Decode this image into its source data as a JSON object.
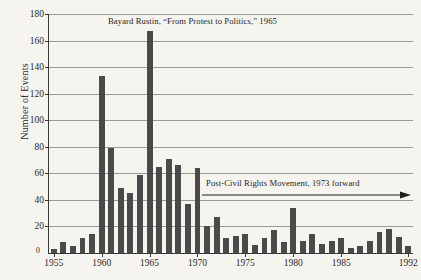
{
  "chart_data": {
    "type": "bar",
    "title": "",
    "xlabel": "",
    "ylabel": "Number of Events",
    "ylim": [
      0,
      180
    ],
    "xlim": [
      1955,
      1992
    ],
    "grid": true,
    "legend": false,
    "bar_color": "#4a4a4a",
    "background_color": "#f6f4ef",
    "axis_color": "#3a3a3a",
    "gridline_color": "#9a9a96",
    "yticks": [
      0,
      20,
      40,
      60,
      80,
      100,
      120,
      140,
      160,
      180
    ],
    "ytick_labels": [
      "0",
      "20",
      "40",
      "60",
      "80",
      "100",
      "120",
      "140",
      "160",
      "180"
    ],
    "xticks": [
      1955,
      1960,
      1965,
      1970,
      1975,
      1980,
      1985,
      1992
    ],
    "xtick_labels": [
      "1955",
      "1960",
      "1965",
      "1970",
      "1975",
      "1980",
      "1985",
      "1992"
    ],
    "categories": [
      1955,
      1956,
      1957,
      1958,
      1959,
      1960,
      1961,
      1962,
      1963,
      1964,
      1965,
      1966,
      1967,
      1968,
      1969,
      1970,
      1971,
      1972,
      1973,
      1974,
      1975,
      1976,
      1977,
      1978,
      1979,
      1980,
      1981,
      1982,
      1983,
      1984,
      1985,
      1986,
      1987,
      1988,
      1989,
      1990,
      1991,
      1992
    ],
    "values": [
      3,
      8,
      5,
      11,
      14,
      133,
      79,
      49,
      45,
      59,
      167,
      65,
      71,
      66,
      37,
      64,
      20,
      27,
      11,
      13,
      14,
      6,
      11,
      17,
      8,
      34,
      9,
      14,
      7,
      9,
      11,
      4,
      5,
      9,
      16,
      18,
      12,
      5
    ],
    "annotations": [
      {
        "id": "rustin",
        "text": "Bayard Rustin, “From Protest to Politics,” 1965",
        "target_year": 1965
      },
      {
        "id": "post-civil-rights",
        "text": "Post-Civil Rights Movement, 1973 forward",
        "target_year": 1973,
        "has_arrow": true
      }
    ]
  }
}
